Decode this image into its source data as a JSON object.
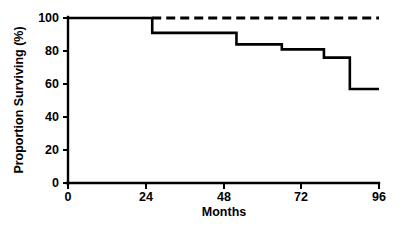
{
  "chart_data": {
    "type": "line",
    "title": "",
    "subtitle": "",
    "xlabel": "Months",
    "ylabel": "Proportion Surviving (%)",
    "xlim": [
      0,
      96
    ],
    "ylim": [
      0,
      100
    ],
    "xticks": [
      0,
      24,
      48,
      72,
      96
    ],
    "yticks": [
      0,
      20,
      40,
      60,
      80,
      100
    ],
    "xtick_labels": [
      "0",
      "24",
      "48",
      "72",
      "96"
    ],
    "ytick_labels": [
      "0",
      "20",
      "40",
      "60",
      "80",
      "100"
    ],
    "grid": false,
    "legend": null,
    "legend_position": "none",
    "annotations": [],
    "series": [
      {
        "name": "Upper curve (dashed)",
        "style": "dashed",
        "color": "#000000",
        "step": "post",
        "x": [
          26,
          96
        ],
        "values": [
          100,
          100
        ]
      },
      {
        "name": "Lower curve (solid)",
        "style": "solid",
        "color": "#000000",
        "step": "post",
        "x": [
          0,
          26,
          52,
          66,
          79,
          96
        ],
        "values": [
          100,
          91,
          84,
          81,
          76,
          57
        ],
        "points": [
          {
            "x": 0,
            "y": 100
          },
          {
            "x": 26,
            "y": 91
          },
          {
            "x": 52,
            "y": 84
          },
          {
            "x": 66,
            "y": 81
          },
          {
            "x": 79,
            "y": 76
          },
          {
            "x": 87,
            "y": 57
          },
          {
            "x": 96,
            "y": 57
          }
        ]
      }
    ]
  }
}
